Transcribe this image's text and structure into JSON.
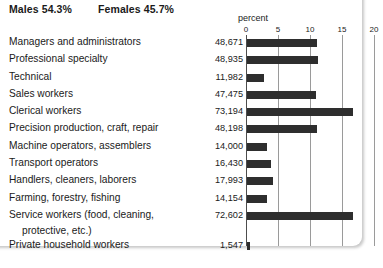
{
  "header": {
    "males": "Males 54.3%",
    "females": "Females 45.7%"
  },
  "chart_data": {
    "type": "bar",
    "orientation": "horizontal",
    "title": "",
    "xlabel": "percent",
    "ylabel": "",
    "xlim": [
      0,
      20
    ],
    "xticks": [
      0,
      5,
      10,
      15,
      20
    ],
    "xticklabels": [
      "0",
      "5",
      "10",
      "15",
      "20"
    ],
    "grid": true,
    "legend": null,
    "value_unit": "thousands of workers",
    "categories": [
      "Managers and administrators",
      "Professional specialty",
      "Technical",
      "Sales workers",
      "Clerical workers",
      "Precision production, craft, repair",
      "Machine operators, assemblers",
      "Transport operators",
      "Handlers, cleaners, laborers",
      "Farming, forestry, fishing",
      "Service workers (food, cleaning, protective, etc.)",
      "Private household workers"
    ],
    "counts": [
      48671,
      48935,
      11982,
      47475,
      73194,
      48198,
      14000,
      16430,
      17993,
      14154,
      72602,
      1547
    ],
    "count_labels": [
      "48,671",
      "48,935",
      "11,982",
      "47,475",
      "73,194",
      "48,198",
      "14,000",
      "16,430",
      "17,993",
      "14,154",
      "72,602",
      "1,547"
    ],
    "values": [
      11.0,
      11.1,
      2.7,
      10.8,
      16.6,
      10.9,
      3.2,
      3.7,
      4.1,
      3.2,
      16.5,
      0.4
    ]
  },
  "rows": [
    {
      "label": "Managers and administrators",
      "label2": "",
      "value": "48,671",
      "percent": 11.0
    },
    {
      "label": "Professional specialty",
      "label2": "",
      "value": "48,935",
      "percent": 11.1
    },
    {
      "label": "Technical",
      "label2": "",
      "value": "11,982",
      "percent": 2.7
    },
    {
      "label": "Sales workers",
      "label2": "",
      "value": "47,475",
      "percent": 10.8
    },
    {
      "label": "Clerical workers",
      "label2": "",
      "value": "73,194",
      "percent": 16.6
    },
    {
      "label": "Precision production, craft, repair",
      "label2": "",
      "value": "48,198",
      "percent": 10.9
    },
    {
      "label": "Machine operators, assemblers",
      "label2": "",
      "value": "14,000",
      "percent": 3.2
    },
    {
      "label": "Transport operators",
      "label2": "",
      "value": "16,430",
      "percent": 3.7
    },
    {
      "label": "Handlers, cleaners, laborers",
      "label2": "",
      "value": "17,993",
      "percent": 4.1
    },
    {
      "label": "Farming, forestry, fishing",
      "label2": "",
      "value": "14,154",
      "percent": 3.2
    },
    {
      "label": "Service workers (food, cleaning,",
      "label2": "protective, etc.)",
      "value": "72,602",
      "percent": 16.5
    },
    {
      "label": "Private household workers",
      "label2": "",
      "value": "1,547",
      "percent": 0.4
    }
  ],
  "colors": {
    "bar": "#2e2e2e",
    "gridline": "#9a9a9a",
    "axis": "#4d4d4d",
    "text": "#1a1a1a",
    "background": "#ffffff"
  }
}
